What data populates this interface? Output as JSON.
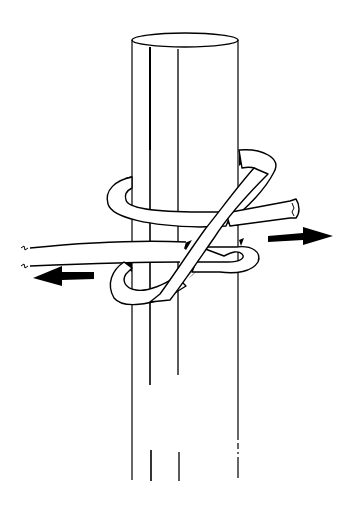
{
  "figure": {
    "background": "#ffffff",
    "ink": "#000000",
    "elements": [
      {
        "name": "post",
        "description": "vertical cylinder with elliptical top"
      },
      {
        "name": "rope",
        "description": "rope wrapping around the post forming a hitch"
      },
      {
        "name": "rope-end",
        "description": "cut rope end extending to the right"
      },
      {
        "name": "standing-part",
        "description": "two rope lines extending to the left with break marks"
      },
      {
        "name": "arrow-right",
        "description": "pull direction arrow pointing right"
      },
      {
        "name": "arrow-left",
        "description": "pull direction arrow pointing left"
      }
    ]
  }
}
